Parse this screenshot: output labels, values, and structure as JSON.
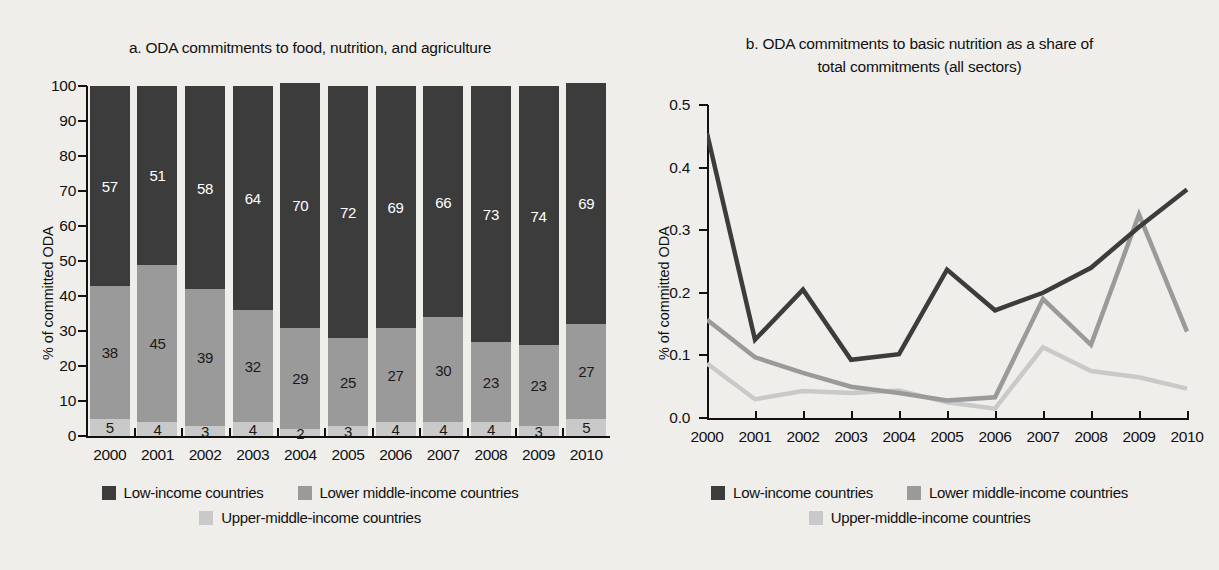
{
  "figure": {
    "background_color": "#efeeeb",
    "series_colors": {
      "low_income": "#3c3c3c",
      "lower_middle_income": "#9a9a9a",
      "upper_middle_income": "#c9c9c9"
    },
    "legend_labels": {
      "low_income": "Low-income countries",
      "lower_middle_income": "Lower middle-income countries",
      "upper_middle_income": "Upper-middle-income countries"
    }
  },
  "panel_a": {
    "title": "a. ODA commitments to food, nutrition, and agriculture",
    "ylabel": "% of committed ODA"
  },
  "panel_b": {
    "title_line1": "b.  ODA commitments to basic nutrition as a share of",
    "title_line2": "total commitments (all sectors)",
    "ylabel": "% of committed ODA"
  },
  "chart_data": [
    {
      "type": "bar",
      "id": "panel-a",
      "stacked": true,
      "title": "a. ODA commitments to food, nutrition, and agriculture",
      "xlabel": "",
      "ylabel": "% of committed ODA",
      "ylim": [
        0,
        100
      ],
      "yticks": [
        0,
        10,
        20,
        30,
        40,
        50,
        60,
        70,
        80,
        90,
        100
      ],
      "grid": false,
      "legend_position": "bottom",
      "categories": [
        "2000",
        "2001",
        "2002",
        "2003",
        "2004",
        "2005",
        "2006",
        "2007",
        "2008",
        "2009",
        "2010"
      ],
      "series": [
        {
          "name": "Low-income countries",
          "color": "#3c3c3c",
          "values": [
            57,
            51,
            58,
            64,
            70,
            72,
            69,
            66,
            73,
            74,
            69
          ]
        },
        {
          "name": "Lower middle-income countries",
          "color": "#9a9a9a",
          "values": [
            38,
            45,
            39,
            32,
            29,
            25,
            27,
            30,
            23,
            23,
            27
          ]
        },
        {
          "name": "Upper-middle-income countries",
          "color": "#c9c9c9",
          "values": [
            5,
            4,
            3,
            4,
            2,
            3,
            4,
            4,
            4,
            3,
            5
          ]
        }
      ]
    },
    {
      "type": "line",
      "id": "panel-b",
      "title": "b. ODA commitments to basic nutrition as a share of total commitments (all sectors)",
      "xlabel": "",
      "ylabel": "% of committed ODA",
      "ylim": [
        0.0,
        0.5
      ],
      "yticks": [
        0.0,
        0.1,
        0.2,
        0.3,
        0.4,
        0.5
      ],
      "ytick_labels": [
        "0.0",
        "0.1",
        "0.2",
        "0.3",
        "0.4",
        "0.5"
      ],
      "grid": false,
      "legend_position": "bottom",
      "x": [
        "2000",
        "2001",
        "2002",
        "2003",
        "2004",
        "2005",
        "2006",
        "2007",
        "2008",
        "2009",
        "2010"
      ],
      "series": [
        {
          "name": "Low-income countries",
          "color": "#3c3c3c",
          "values": [
            0.455,
            0.125,
            0.205,
            0.093,
            0.102,
            0.237,
            0.172,
            0.2,
            0.24,
            0.305,
            0.365
          ]
        },
        {
          "name": "Lower middle-income countries",
          "color": "#9a9a9a",
          "values": [
            0.157,
            0.097,
            0.072,
            0.05,
            0.04,
            0.028,
            0.033,
            0.19,
            0.117,
            0.325,
            0.138
          ]
        },
        {
          "name": "Upper-middle-income countries",
          "color": "#c9c9c9",
          "values": [
            0.087,
            0.03,
            0.043,
            0.04,
            0.044,
            0.025,
            0.015,
            0.113,
            0.075,
            0.065,
            0.047
          ]
        }
      ]
    }
  ],
  "ytick_labels_a": [
    "100",
    "90",
    "80",
    "70",
    "60",
    "50",
    "40",
    "30",
    "20",
    "10",
    "0"
  ],
  "xtick_labels": [
    "2000",
    "2001",
    "2002",
    "2003",
    "2004",
    "2005",
    "2006",
    "2007",
    "2008",
    "2009",
    "2010"
  ],
  "footer": {
    "source_fragment": ""
  }
}
